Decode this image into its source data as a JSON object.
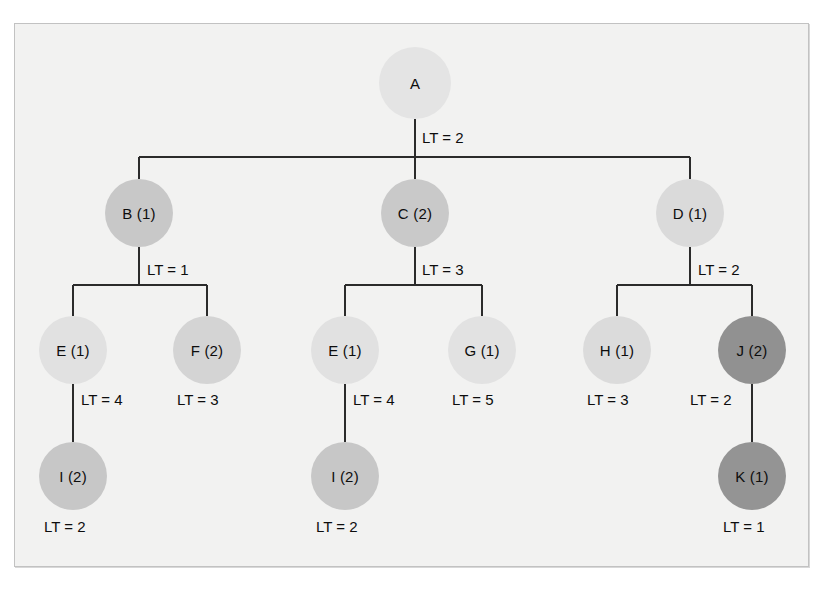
{
  "diagram": {
    "type": "tree",
    "title": "",
    "background_color": "#f2f2f1",
    "frame_border_color": "#c2c2c2",
    "edge_color": "#2b2b2b",
    "text_color": "#0d0d0d",
    "shades": {
      "very_light": "#e2e2e2",
      "light": "#dcdcdc",
      "medium_light": "#d2d2d2",
      "medium": "#c6c6c6",
      "dark": "#8f8f8f"
    },
    "nodes": [
      {
        "id": "A",
        "label": "A",
        "name": "A",
        "count": null,
        "x": 415,
        "y": 83,
        "r": 36,
        "shade": "very_light",
        "color": "#e4e4e4",
        "level": 0
      },
      {
        "id": "B",
        "label": "B (1)",
        "name": "B",
        "count": 1,
        "x": 139,
        "y": 213,
        "r": 34,
        "shade": "medium",
        "color": "#c8c8c8",
        "level": 1
      },
      {
        "id": "C",
        "label": "C (2)",
        "name": "C",
        "count": 2,
        "x": 415,
        "y": 213,
        "r": 34,
        "shade": "medium",
        "color": "#c9c9c9",
        "level": 1
      },
      {
        "id": "D",
        "label": "D (1)",
        "name": "D",
        "count": 1,
        "x": 690,
        "y": 213,
        "r": 34,
        "shade": "light",
        "color": "#dadada",
        "level": 1
      },
      {
        "id": "E1",
        "label": "E (1)",
        "name": "E",
        "count": 1,
        "x": 73,
        "y": 350,
        "r": 34,
        "shade": "very_light",
        "color": "#e1e1e1",
        "level": 2
      },
      {
        "id": "F",
        "label": "F (2)",
        "name": "F",
        "count": 2,
        "x": 207,
        "y": 350,
        "r": 34,
        "shade": "medium_light",
        "color": "#d4d4d4",
        "level": 2
      },
      {
        "id": "E2",
        "label": "E (1)",
        "name": "E",
        "count": 1,
        "x": 345,
        "y": 350,
        "r": 34,
        "shade": "very_light",
        "color": "#e1e1e1",
        "level": 2
      },
      {
        "id": "G",
        "label": "G (1)",
        "name": "G",
        "count": 1,
        "x": 482,
        "y": 350,
        "r": 34,
        "shade": "very_light",
        "color": "#e2e2e2",
        "level": 2
      },
      {
        "id": "H",
        "label": "H (1)",
        "name": "H",
        "count": 1,
        "x": 617,
        "y": 350,
        "r": 34,
        "shade": "light",
        "color": "#dbdbdb",
        "level": 2
      },
      {
        "id": "J",
        "label": "J (2)",
        "name": "J",
        "count": 2,
        "x": 752,
        "y": 350,
        "r": 34,
        "shade": "dark",
        "color": "#919191",
        "level": 2
      },
      {
        "id": "I1",
        "label": "I (2)",
        "name": "I",
        "count": 2,
        "x": 73,
        "y": 476,
        "r": 34,
        "shade": "medium",
        "color": "#c7c7c7",
        "level": 3
      },
      {
        "id": "I2",
        "label": "I (2)",
        "name": "I",
        "count": 2,
        "x": 345,
        "y": 476,
        "r": 34,
        "shade": "medium",
        "color": "#c7c7c7",
        "level": 3
      },
      {
        "id": "K",
        "label": "K (1)",
        "name": "K",
        "count": 1,
        "x": 752,
        "y": 476,
        "r": 34,
        "shade": "dark",
        "color": "#949494",
        "level": 3
      }
    ],
    "edge_labels": [
      {
        "id": "lt-A",
        "text": "LT = 2",
        "value": 2,
        "for_node": "A",
        "x": 422,
        "y": 130
      },
      {
        "id": "lt-B",
        "text": "LT = 1",
        "value": 1,
        "for_node": "B",
        "x": 147,
        "y": 262
      },
      {
        "id": "lt-C",
        "text": "LT = 3",
        "value": 3,
        "for_node": "C",
        "x": 422,
        "y": 262
      },
      {
        "id": "lt-D",
        "text": "LT = 2",
        "value": 2,
        "for_node": "D",
        "x": 698,
        "y": 262
      },
      {
        "id": "lt-E1",
        "text": "LT = 4",
        "value": 4,
        "for_node": "E1",
        "x": 81,
        "y": 392
      },
      {
        "id": "lt-F",
        "text": "LT = 3",
        "value": 3,
        "for_node": "F",
        "x": 177,
        "y": 392
      },
      {
        "id": "lt-E2",
        "text": "LT = 4",
        "value": 4,
        "for_node": "E2",
        "x": 353,
        "y": 392
      },
      {
        "id": "lt-G",
        "text": "LT = 5",
        "value": 5,
        "for_node": "G",
        "x": 452,
        "y": 392
      },
      {
        "id": "lt-H",
        "text": "LT = 3",
        "value": 3,
        "for_node": "H",
        "x": 587,
        "y": 392
      },
      {
        "id": "lt-J",
        "text": "LT = 2",
        "value": 2,
        "for_node": "J",
        "x": 690,
        "y": 392
      },
      {
        "id": "lt-I1",
        "text": "LT = 2",
        "value": 2,
        "for_node": "I1",
        "x": 44,
        "y": 519
      },
      {
        "id": "lt-I2",
        "text": "LT = 2",
        "value": 2,
        "for_node": "I2",
        "x": 316,
        "y": 519
      },
      {
        "id": "lt-K",
        "text": "LT = 1",
        "value": 1,
        "for_node": "K",
        "x": 723,
        "y": 519
      }
    ],
    "edges": [
      {
        "from": "A",
        "to": "B"
      },
      {
        "from": "A",
        "to": "C"
      },
      {
        "from": "A",
        "to": "D"
      },
      {
        "from": "B",
        "to": "E1"
      },
      {
        "from": "B",
        "to": "F"
      },
      {
        "from": "C",
        "to": "E2"
      },
      {
        "from": "C",
        "to": "G"
      },
      {
        "from": "D",
        "to": "H"
      },
      {
        "from": "D",
        "to": "J"
      },
      {
        "from": "E1",
        "to": "I1"
      },
      {
        "from": "E2",
        "to": "I2"
      },
      {
        "from": "J",
        "to": "K"
      }
    ]
  }
}
